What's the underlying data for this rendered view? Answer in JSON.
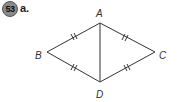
{
  "problem": {
    "number": "53",
    "part": "a."
  },
  "figure": {
    "vertices": [
      {
        "label": "A",
        "x": 100,
        "y": 23
      },
      {
        "label": "B",
        "x": 47,
        "y": 52
      },
      {
        "label": "C",
        "x": 155,
        "y": 52
      },
      {
        "label": "D",
        "x": 100,
        "y": 82
      }
    ],
    "segments": [
      "AB",
      "AC",
      "BD",
      "CD",
      "AD"
    ],
    "congruence_marks": {
      "AB": 2,
      "AC": 2,
      "BD": 2,
      "CD": 2
    },
    "line_color": "#333333"
  }
}
